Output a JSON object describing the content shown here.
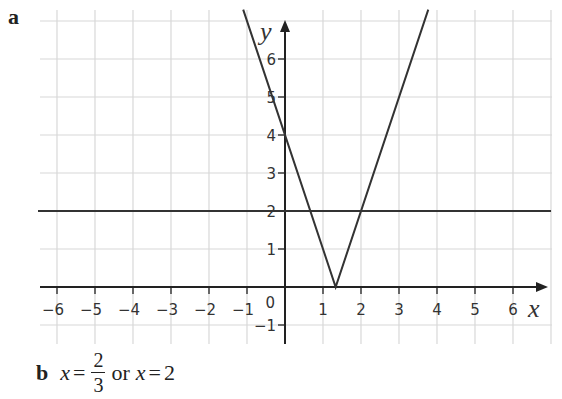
{
  "part_a": {
    "label": "a"
  },
  "part_b": {
    "label": "b",
    "answer": {
      "var1": "x",
      "eq1": "=",
      "frac_num": "2",
      "frac_den": "3",
      "connector": "or",
      "var2": "x",
      "eq2": "=",
      "value2": "2"
    }
  },
  "colors": {
    "grid": "#d8d8d8",
    "axis": "#222222",
    "line": "#333333"
  },
  "chart_data": {
    "type": "line",
    "title": "",
    "xlabel": "x",
    "ylabel": "y",
    "xlim": [
      -6.5,
      6.5
    ],
    "ylim": [
      -1.5,
      7.3
    ],
    "grid": true,
    "x_ticks": [
      "-6",
      "-5",
      "-4",
      "-3",
      "-2",
      "-1",
      "1",
      "2",
      "3",
      "4",
      "5",
      "6"
    ],
    "y_ticks": [
      "-1",
      "1",
      "2",
      "3",
      "4",
      "5",
      "6"
    ],
    "origin_label": "0",
    "series": [
      {
        "name": "y = |3x - 4|",
        "points": [
          [
            -1.1,
            7.3
          ],
          [
            1.333,
            0
          ],
          [
            3.77,
            7.3
          ]
        ]
      },
      {
        "name": "y = 2",
        "points": [
          [
            -6.5,
            2
          ],
          [
            7.0,
            2
          ]
        ]
      }
    ],
    "annotations": [
      "Intersections at x = 2/3 and x = 2"
    ]
  }
}
